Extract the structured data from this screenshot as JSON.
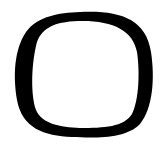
{
  "glyph": {
    "character": "O",
    "icon": "letter-o-glyph",
    "fill_color": "#000000",
    "background_color": "#ffffff"
  }
}
